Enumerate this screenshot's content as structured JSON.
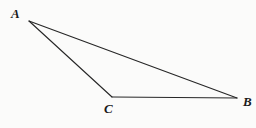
{
  "figure": {
    "type": "geometry-diagram",
    "shape": "triangle",
    "background_color": "#fbfbfa",
    "stroke_color": "#262626",
    "stroke_width": 1.1,
    "label_color": "#1a1a1a",
    "vertices": [
      {
        "id": "A",
        "label": "A",
        "x": 29,
        "y": 21,
        "label_x": 11,
        "label_y": 7
      },
      {
        "id": "B",
        "label": "B",
        "x": 237,
        "y": 98,
        "label_x": 243,
        "label_y": 95
      },
      {
        "id": "C",
        "label": "C",
        "x": 112,
        "y": 97,
        "label_x": 104,
        "label_y": 102
      }
    ],
    "edges": [
      {
        "id": "AB",
        "from": "A",
        "to": "B"
      },
      {
        "id": "AC",
        "from": "A",
        "to": "C"
      },
      {
        "id": "CB",
        "from": "C",
        "to": "B"
      }
    ]
  }
}
